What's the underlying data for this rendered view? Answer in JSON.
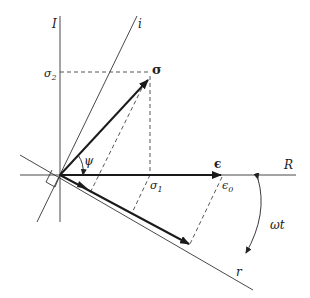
{
  "diagram": {
    "type": "phasor-diagram",
    "colors": {
      "line": "#333333",
      "bold": "#1a1a1a",
      "background": "#ffffff"
    },
    "axes": {
      "I_label": "I",
      "i_label": "i",
      "R_label": "R",
      "r_label": "r"
    },
    "vectors": {
      "sigma_label": "σ",
      "epsilon_label": "ϵ"
    },
    "projections": {
      "sigma2_label": "σ",
      "sigma2_sub": "2",
      "sigma1_label": "σ",
      "sigma1_sub": "1",
      "epsilon0_label": "ϵ",
      "epsilon0_sub": "0"
    },
    "angles": {
      "psi_label": "ψ",
      "omega_t_label": "ωt"
    }
  }
}
